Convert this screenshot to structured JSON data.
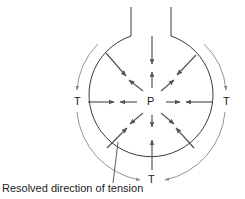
{
  "diagram": {
    "labels": {
      "pressure": "P",
      "tension_left": "T",
      "tension_right": "T",
      "tension_bottom": "T"
    },
    "caption": "Resolved direction of tension",
    "colors": {
      "outline": "#3a3a3a",
      "force_arrow": "#555555",
      "tension_arrow": "#8a8a8a",
      "text": "#222222"
    }
  }
}
